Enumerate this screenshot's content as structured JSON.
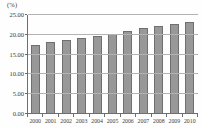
{
  "chart_data": {
    "type": "bar",
    "title": "",
    "unit_label": "(%)",
    "xlabel": "",
    "ylabel": "(%)",
    "categories": [
      "2000",
      "2001",
      "2002",
      "2003",
      "2004",
      "2005",
      "2006",
      "2007",
      "2008",
      "2009",
      "2010"
    ],
    "values": [
      17.4,
      18.0,
      18.5,
      19.0,
      19.6,
      20.2,
      20.8,
      21.5,
      22.1,
      22.7,
      23.0
    ],
    "ylim": [
      0,
      25
    ],
    "ytick_labels": [
      "25.00",
      "20.00",
      "15.00",
      "10.00",
      "5.00",
      "0.00"
    ],
    "ytick_values": [
      25,
      20,
      15,
      10,
      5,
      0
    ],
    "grid": true,
    "legend_position": "none",
    "colors": {
      "bar_fill": "#989898",
      "bar_border": "#6f6f6f",
      "gridline": "#b3b3b3",
      "axis": "#6e6e6e",
      "text": "#3a3a3a",
      "background": "#fefefe"
    }
  }
}
